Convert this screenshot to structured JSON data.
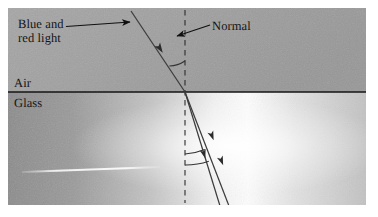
{
  "figure": {
    "type": "optics-ray-diagram",
    "canvas": {
      "width": 378,
      "height": 217
    },
    "labels": {
      "source_line1": "Blue and",
      "source_line2": "red light",
      "normal": "Normal",
      "medium_top": "Air",
      "medium_bottom": "Glass"
    },
    "media": {
      "top": {
        "name": "Air",
        "fill_start": "#a3a3a3",
        "fill_end": "#9b9b9b"
      },
      "bottom": {
        "name": "Glass",
        "fill_left": "#8f8f8f",
        "fill_mid": "#fdfdfd",
        "fill_right": "#c9c9c9"
      }
    },
    "colors": {
      "interface_line": "#1b1b1b",
      "ray_line": "#3a3a3a",
      "normal_dash": "#2b2b2b",
      "leader_line": "#111111",
      "arc_line": "#333333",
      "highlight_line": "#f0f0f0",
      "text": "#141414",
      "page_background": "#ffffff"
    },
    "geometry": {
      "plot_left": 8,
      "plot_top": 8,
      "plot_right": 366,
      "plot_bottom": 205,
      "interface_y": 92,
      "incidence_point_x": 185,
      "incidence_point_y": 92,
      "normal_x": 185,
      "normal_top_y": 10,
      "normal_bottom_y": 203
    },
    "rays": [
      {
        "name": "incident-ray",
        "description": "Incoming combined blue and red light beam",
        "x1": 131,
        "y1": 11,
        "x2": 185,
        "y2": 92,
        "has_arrow": true,
        "arrow_at_x": 160,
        "arrow_at_y": 49
      },
      {
        "name": "refracted-ray-red",
        "description": "Refracted red light, bent less",
        "x1": 185,
        "y1": 92,
        "x2": 228,
        "y2": 205,
        "has_arrow": true,
        "arrow_at_x": 211,
        "arrow_at_y": 163
      },
      {
        "name": "refracted-ray-blue",
        "description": "Refracted blue light, bent more",
        "x1": 185,
        "y1": 92,
        "x2": 219,
        "y2": 205,
        "has_arrow": true,
        "arrow_at_x": 204,
        "arrow_at_y": 165
      }
    ],
    "angle_arcs": [
      {
        "name": "angle-of-incidence-arc",
        "radius": 31,
        "side": "above-interface"
      },
      {
        "name": "angle-of-refraction-arc-outer",
        "radius": 62,
        "side": "below-interface"
      },
      {
        "name": "angle-of-refraction-arc-inner",
        "radius": 73,
        "side": "below-interface"
      }
    ],
    "leaders": [
      {
        "name": "source-label-leader",
        "from_x": 66,
        "from_y": 26,
        "to_x": 132,
        "to_y": 22,
        "arrowhead": "end"
      },
      {
        "name": "normal-label-leader",
        "from_x": 210,
        "from_y": 26,
        "to_x": 177,
        "to_y": 36,
        "arrowhead": "end"
      }
    ],
    "highlight": {
      "name": "glass-highlight-streak",
      "x1": 22,
      "y1": 172,
      "x2": 160,
      "y2": 167
    }
  }
}
